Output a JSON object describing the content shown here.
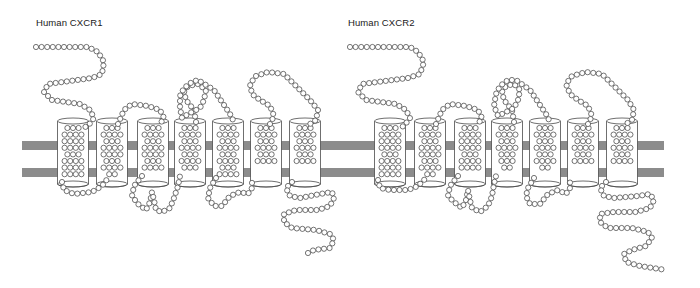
{
  "receptors": [
    {
      "label": "Human CXCR1",
      "label_pos": [
        36,
        24
      ],
      "helices": [
        {
          "cx": 73,
          "rows": [
            3,
            4,
            4,
            4,
            3,
            4,
            4,
            4
          ]
        },
        {
          "cx": 112,
          "rows": [
            3,
            4,
            3,
            4,
            4,
            3,
            4,
            2
          ]
        },
        {
          "cx": 153,
          "rows": [
            3,
            4,
            3,
            4,
            4,
            3,
            4
          ]
        },
        {
          "cx": 190,
          "rows": [
            3,
            4,
            3,
            4,
            3,
            4,
            3
          ]
        },
        {
          "cx": 228,
          "rows": [
            3,
            4,
            3,
            4,
            3,
            4,
            3,
            4
          ]
        },
        {
          "cx": 266,
          "rows": [
            3,
            4,
            3,
            4,
            3,
            4
          ]
        },
        {
          "cx": 305,
          "rows": [
            3,
            4,
            3,
            4,
            3,
            4
          ]
        }
      ],
      "loops": [
        {
          "name": "n-terminus",
          "points": [
            [
              36,
              47
            ],
            [
              88,
              47
            ],
            [
              98,
              52
            ],
            [
              104,
              62
            ],
            [
              102,
              74
            ],
            [
              92,
              78
            ],
            [
              48,
              84
            ],
            [
              44,
              92
            ],
            [
              52,
              100
            ],
            [
              80,
              104
            ],
            [
              90,
              110
            ],
            [
              94,
              118
            ],
            [
              88,
              126
            ],
            [
              82,
              128
            ]
          ]
        },
        {
          "name": "ecl1",
          "points": [
            [
              118,
              124
            ],
            [
              124,
              110
            ],
            [
              132,
              104
            ],
            [
              148,
              106
            ],
            [
              160,
              110
            ],
            [
              164,
              118
            ],
            [
              160,
              124
            ]
          ]
        },
        {
          "name": "ecl2",
          "points": [
            [
              196,
              122
            ],
            [
              194,
              110
            ],
            [
              186,
              100
            ],
            [
              184,
              92
            ],
            [
              188,
              86
            ],
            [
              198,
              84
            ],
            [
              206,
              90
            ],
            [
              204,
              100
            ],
            [
              200,
              108
            ],
            [
              196,
              110
            ],
            [
              188,
              114
            ],
            [
              182,
              118
            ],
            [
              180,
              108
            ],
            [
              180,
              96
            ],
            [
              184,
              88
            ],
            [
              192,
              82
            ],
            [
              198,
              80
            ],
            [
              214,
              90
            ],
            [
              222,
              102
            ],
            [
              230,
              114
            ],
            [
              234,
              122
            ]
          ]
        },
        {
          "name": "ecl3",
          "points": [
            [
              270,
              124
            ],
            [
              274,
              116
            ],
            [
              270,
              106
            ],
            [
              260,
              100
            ],
            [
              252,
              94
            ],
            [
              250,
              84
            ],
            [
              256,
              76
            ],
            [
              268,
              72
            ],
            [
              284,
              74
            ],
            [
              296,
              86
            ],
            [
              310,
              100
            ],
            [
              318,
              110
            ],
            [
              316,
              120
            ],
            [
              310,
              124
            ]
          ]
        },
        {
          "name": "icl1",
          "points": [
            [
              62,
              182
            ],
            [
              64,
              190
            ],
            [
              74,
              194
            ],
            [
              92,
              192
            ],
            [
              102,
              186
            ],
            [
              108,
              178
            ]
          ]
        },
        {
          "name": "icl2",
          "points": [
            [
              142,
              176
            ],
            [
              134,
              186
            ],
            [
              132,
              196
            ],
            [
              138,
              204
            ],
            [
              146,
              210
            ],
            [
              150,
              202
            ],
            [
              152,
              192
            ],
            [
              154,
              200
            ],
            [
              156,
              210
            ],
            [
              162,
              212
            ],
            [
              170,
              208
            ],
            [
              174,
              198
            ],
            [
              178,
              186
            ],
            [
              180,
              176
            ]
          ]
        },
        {
          "name": "icl3",
          "points": [
            [
              216,
              178
            ],
            [
              210,
              188
            ],
            [
              208,
              198
            ],
            [
              214,
              206
            ],
            [
              222,
              206
            ],
            [
              230,
              196
            ],
            [
              240,
              192
            ],
            [
              248,
              194
            ],
            [
              252,
              188
            ],
            [
              252,
              180
            ]
          ]
        },
        {
          "name": "c-terminus",
          "points": [
            [
              292,
              182
            ],
            [
              286,
              188
            ],
            [
              290,
              196
            ],
            [
              300,
              198
            ],
            [
              320,
              194
            ],
            [
              332,
              192
            ],
            [
              334,
              198
            ],
            [
              330,
              206
            ],
            [
              318,
              210
            ],
            [
              296,
              210
            ],
            [
              284,
              214
            ],
            [
              284,
              222
            ],
            [
              292,
              228
            ],
            [
              316,
              230
            ],
            [
              330,
              234
            ],
            [
              334,
              240
            ],
            [
              330,
              248
            ],
            [
              314,
              250
            ],
            [
              306,
              254
            ]
          ]
        }
      ]
    },
    {
      "label": "Human CXCR2",
      "label_pos": [
        348,
        24
      ],
      "helices": [
        {
          "cx": 390,
          "rows": [
            3,
            4,
            4,
            4,
            3,
            4,
            4,
            4
          ]
        },
        {
          "cx": 430,
          "rows": [
            3,
            4,
            3,
            4,
            4,
            3,
            4,
            2
          ]
        },
        {
          "cx": 470,
          "rows": [
            3,
            4,
            4,
            4,
            3,
            4,
            4
          ]
        },
        {
          "cx": 507,
          "rows": [
            3,
            4,
            3,
            4,
            3,
            3,
            2
          ]
        },
        {
          "cx": 545,
          "rows": [
            3,
            4,
            3,
            4,
            3,
            4,
            2
          ]
        },
        {
          "cx": 583,
          "rows": [
            3,
            4,
            3,
            4,
            3,
            4
          ]
        },
        {
          "cx": 622,
          "rows": [
            3,
            4,
            3,
            4,
            3,
            4
          ]
        }
      ],
      "loops": [
        {
          "name": "n-terminus",
          "points": [
            [
              350,
              47
            ],
            [
              410,
              47
            ],
            [
              418,
              52
            ],
            [
              424,
              62
            ],
            [
              420,
              74
            ],
            [
              408,
              78
            ],
            [
              362,
              84
            ],
            [
              358,
              92
            ],
            [
              366,
              100
            ],
            [
              396,
              104
            ],
            [
              406,
              110
            ],
            [
              410,
              118
            ],
            [
              404,
              126
            ],
            [
              398,
              128
            ]
          ]
        },
        {
          "name": "ecl1",
          "points": [
            [
              436,
              124
            ],
            [
              442,
              110
            ],
            [
              450,
              104
            ],
            [
              466,
              106
            ],
            [
              478,
              110
            ],
            [
              482,
              118
            ],
            [
              478,
              124
            ]
          ]
        },
        {
          "name": "ecl2",
          "points": [
            [
              514,
              122
            ],
            [
              512,
              110
            ],
            [
              504,
              100
            ],
            [
              502,
              92
            ],
            [
              506,
              86
            ],
            [
              514,
              84
            ],
            [
              520,
              90
            ],
            [
              518,
              100
            ],
            [
              514,
              108
            ],
            [
              506,
              112
            ],
            [
              498,
              116
            ],
            [
              494,
              106
            ],
            [
              496,
              94
            ],
            [
              500,
              86
            ],
            [
              508,
              80
            ],
            [
              516,
              80
            ],
            [
              530,
              90
            ],
            [
              538,
              102
            ],
            [
              546,
              114
            ],
            [
              550,
              122
            ]
          ]
        },
        {
          "name": "ecl3",
          "points": [
            [
              588,
              124
            ],
            [
              592,
              116
            ],
            [
              588,
              106
            ],
            [
              578,
              100
            ],
            [
              570,
              94
            ],
            [
              566,
              84
            ],
            [
              572,
              76
            ],
            [
              586,
              72
            ],
            [
              602,
              74
            ],
            [
              614,
              86
            ],
            [
              628,
              100
            ],
            [
              634,
              110
            ],
            [
              632,
              120
            ],
            [
              626,
              124
            ]
          ]
        },
        {
          "name": "icl1",
          "points": [
            [
              378,
              180
            ],
            [
              380,
              188
            ],
            [
              390,
              190
            ],
            [
              408,
              190
            ],
            [
              418,
              186
            ],
            [
              426,
              178
            ]
          ]
        },
        {
          "name": "icl2",
          "points": [
            [
              458,
              176
            ],
            [
              450,
              186
            ],
            [
              448,
              196
            ],
            [
              454,
              202
            ],
            [
              462,
              208
            ],
            [
              466,
              200
            ],
            [
              468,
              190
            ],
            [
              470,
              200
            ],
            [
              472,
              208
            ],
            [
              480,
              212
            ],
            [
              488,
              206
            ],
            [
              492,
              196
            ],
            [
              494,
              184
            ],
            [
              496,
              176
            ]
          ]
        },
        {
          "name": "icl3",
          "points": [
            [
              534,
              178
            ],
            [
              528,
              188
            ],
            [
              526,
              196
            ],
            [
              530,
              204
            ],
            [
              540,
              204
            ],
            [
              548,
              194
            ],
            [
              558,
              190
            ],
            [
              566,
              194
            ],
            [
              570,
              188
            ],
            [
              570,
              180
            ]
          ]
        },
        {
          "name": "c-terminus",
          "points": [
            [
              606,
              182
            ],
            [
              600,
              188
            ],
            [
              604,
              196
            ],
            [
              614,
              198
            ],
            [
              638,
              196
            ],
            [
              650,
              194
            ],
            [
              654,
              200
            ],
            [
              650,
              208
            ],
            [
              636,
              212
            ],
            [
              614,
              212
            ],
            [
              600,
              214
            ],
            [
              600,
              222
            ],
            [
              608,
              228
            ],
            [
              632,
              228
            ],
            [
              648,
              232
            ],
            [
              652,
              238
            ],
            [
              646,
              246
            ],
            [
              632,
              250
            ],
            [
              624,
              254
            ],
            [
              626,
              262
            ],
            [
              640,
              266
            ],
            [
              666,
              270
            ]
          ]
        }
      ]
    }
  ],
  "membrane": {
    "color": "#8c8c8c",
    "bars": [
      {
        "x": 22,
        "y": 141,
        "w": 642,
        "h": 9
      },
      {
        "x": 22,
        "y": 168,
        "w": 642,
        "h": 9
      }
    ]
  },
  "helix_geometry": {
    "width": 31,
    "top": 121,
    "bottom": 184
  },
  "bead_radius": 2.6,
  "bead_spacing": 5.6
}
